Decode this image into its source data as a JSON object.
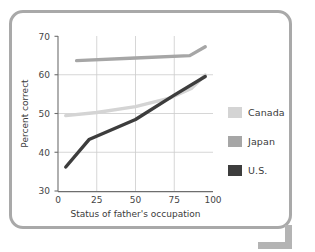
{
  "figure": {
    "alt_title": "Percent correct by status of father's occupation",
    "frame_color": "#a9a9a9",
    "background": "#ffffff"
  },
  "legend": {
    "position": "right",
    "entries": [
      {
        "label": "Canada",
        "color": "#d4d4d4",
        "swatch_name": "legend-swatch-canada"
      },
      {
        "label": "Japan",
        "color": "#a6a6a6",
        "swatch_name": "legend-swatch-japan"
      },
      {
        "label": "U.S.",
        "color": "#3d3d3d",
        "swatch_name": "legend-swatch-us"
      }
    ]
  },
  "axes": {
    "x_label": "Status of father's occupation",
    "y_label": "Percent correct",
    "x_ticks": [
      "0",
      "25",
      "50",
      "75",
      "100"
    ],
    "y_ticks": [
      "30",
      "40",
      "50",
      "60",
      "70"
    ],
    "x_min": 0,
    "x_max": 100,
    "y_min": 30,
    "y_max": 70,
    "grid": "on",
    "grid_color": "#cccccc"
  },
  "chart_data": {
    "type": "line",
    "title": "",
    "subtitle": "",
    "xlabel": "Status of father's occupation",
    "ylabel": "Percent correct",
    "xlim": [
      0,
      100
    ],
    "ylim": [
      30,
      70
    ],
    "xticks": [
      0,
      25,
      50,
      75,
      100
    ],
    "yticks": [
      30,
      40,
      50,
      60,
      70
    ],
    "grid": true,
    "legend_position": "right",
    "series": [
      {
        "name": "Canada",
        "color": "#d4d4d4",
        "x": [
          5,
          25,
          50,
          72,
          86,
          95
        ],
        "y": [
          49.5,
          50.3,
          51.8,
          54.0,
          56.5,
          60.0
        ]
      },
      {
        "name": "Japan",
        "color": "#a6a6a6",
        "x": [
          12,
          50,
          85,
          95
        ],
        "y": [
          63.7,
          64.4,
          65.0,
          67.3
        ]
      },
      {
        "name": "U.S.",
        "color": "#3d3d3d",
        "x": [
          5,
          20,
          50,
          75,
          95
        ],
        "y": [
          36.2,
          43.3,
          48.5,
          54.8,
          59.6
        ]
      }
    ]
  }
}
